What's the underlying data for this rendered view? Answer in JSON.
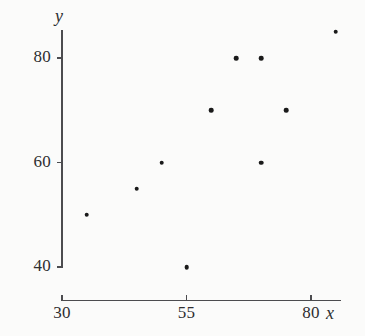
{
  "chart_data": {
    "type": "scatter",
    "title": "",
    "xlabel": "x",
    "ylabel": "y",
    "xlim": [
      30,
      86
    ],
    "ylim": [
      38,
      87
    ],
    "grid": false,
    "legend": null,
    "x_ticks": [
      {
        "value": 30,
        "label": "30"
      },
      {
        "value": 55,
        "label": "55"
      },
      {
        "value": 80,
        "label": "80"
      }
    ],
    "y_ticks": [
      {
        "value": 40,
        "label": "40"
      },
      {
        "value": 60,
        "label": "60"
      },
      {
        "value": 80,
        "label": "80"
      }
    ],
    "points": [
      {
        "x": 35,
        "y": 50
      },
      {
        "x": 45,
        "y": 55
      },
      {
        "x": 50,
        "y": 60
      },
      {
        "x": 55,
        "y": 40
      },
      {
        "x": 60,
        "y": 70
      },
      {
        "x": 65,
        "y": 80
      },
      {
        "x": 70,
        "y": 80
      },
      {
        "x": 70,
        "y": 60
      },
      {
        "x": 75,
        "y": 70
      },
      {
        "x": 85,
        "y": 85
      }
    ],
    "marker_color": "#1a1a1a",
    "axis_color": "#4c4c4f",
    "background_color": "#fbfbfa"
  }
}
